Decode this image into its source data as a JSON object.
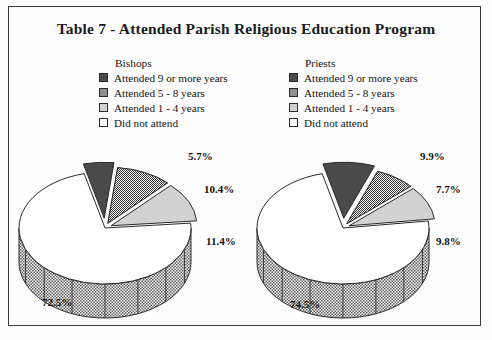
{
  "title": "Table 7 - Attended Parish Religious Education Program",
  "colors": {
    "attended_9_plus": "#4a4a4a",
    "attended_5_8": "#8f8f8f",
    "attended_1_4": "#d2d2d2",
    "did_not_attend": "#ffffff",
    "outline": "#2a2a2a",
    "frame": "#3b3b3b",
    "background": "#fdfdfd",
    "text": "#141414"
  },
  "legends": [
    {
      "name": "bishops",
      "heading": "Bishops",
      "items": [
        {
          "label": "Attended 9 or more years",
          "swatch": "dark"
        },
        {
          "label": "Attended 5 - 8 years",
          "swatch": "med"
        },
        {
          "label": "Attended 1 - 4 years",
          "swatch": "light"
        },
        {
          "label": "Did not attend",
          "swatch": "white"
        }
      ]
    },
    {
      "name": "priests",
      "heading": "Priests",
      "items": [
        {
          "label": "Attended 9 or more years",
          "swatch": "dark"
        },
        {
          "label": "Attended 5 - 8 years",
          "swatch": "med"
        },
        {
          "label": "Attended 1 - 4 years",
          "swatch": "light"
        },
        {
          "label": "Did not attend",
          "swatch": "white"
        }
      ]
    }
  ],
  "pies": [
    {
      "name": "bishops",
      "labels": {
        "attended_9_plus": "5.7%",
        "attended_5_8": "10.4%",
        "attended_1_4": "11.4%",
        "did_not_attend": "72.5%"
      }
    },
    {
      "name": "priests",
      "labels": {
        "attended_9_plus": "9.9%",
        "attended_5_8": "7.7%",
        "attended_1_4": "9.8%",
        "did_not_attend": "74.5%"
      }
    }
  ],
  "chart_data": {
    "type": "pie",
    "title": "Table 7 - Attended Parish Religious Education Program",
    "categories": [
      "Attended 9 or more years",
      "Attended 5 - 8 years",
      "Attended 1 - 4 years",
      "Did not attend"
    ],
    "series": [
      {
        "name": "Bishops",
        "values": [
          5.7,
          10.4,
          11.4,
          72.5
        ],
        "data_labels": [
          "5.7%",
          "10.4%",
          "11.4%",
          "72.5%"
        ]
      },
      {
        "name": "Priests",
        "values": [
          9.9,
          7.7,
          9.8,
          74.5
        ],
        "data_labels": [
          "9.9%",
          "7.7%",
          "9.8%",
          "74.5%"
        ]
      }
    ],
    "units": "percent",
    "legend_position": "top",
    "grid": false,
    "three_d": true,
    "exploded": true
  }
}
